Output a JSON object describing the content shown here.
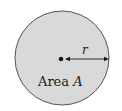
{
  "diagram": {
    "shape": "circle",
    "fill_color": "#d9d9d9",
    "stroke_color": "#555555",
    "center_label": "",
    "radius_label": "r",
    "area_label_prefix": "Area ",
    "area_label_var": "A"
  }
}
